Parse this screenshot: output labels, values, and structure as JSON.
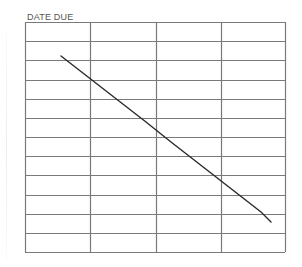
{
  "card": {
    "title": "DATE DUE",
    "columns": 4,
    "rows": 12,
    "grid_color": "#7a7a7a",
    "line_color": "#2a2a2a",
    "cells": [
      [
        "",
        "",
        "",
        ""
      ],
      [
        "",
        "",
        "",
        ""
      ],
      [
        "",
        "",
        "",
        ""
      ],
      [
        "",
        "",
        "",
        ""
      ],
      [
        "",
        "",
        "",
        ""
      ],
      [
        "",
        "",
        "",
        ""
      ],
      [
        "",
        "",
        "",
        ""
      ],
      [
        "",
        "",
        "",
        ""
      ],
      [
        "",
        "",
        "",
        ""
      ],
      [
        "",
        "",
        "",
        ""
      ],
      [
        "",
        "",
        "",
        ""
      ],
      [
        "",
        "",
        "",
        ""
      ]
    ],
    "strike_line": {
      "x1": 61,
      "y1": 56,
      "x2": 271,
      "y2": 222
    }
  }
}
